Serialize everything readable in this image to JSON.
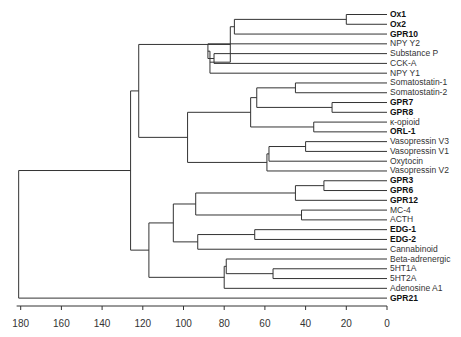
{
  "chart_data": {
    "type": "dendrogram",
    "title": "",
    "xlabel": "",
    "x_axis": {
      "ticks": [
        180,
        160,
        140,
        120,
        100,
        80,
        60,
        40,
        20,
        0
      ],
      "range": [
        180,
        0
      ]
    },
    "leaves": [
      {
        "label": "Ox1",
        "bold": true
      },
      {
        "label": "Ox2",
        "bold": true
      },
      {
        "label": "GPR10",
        "bold": true
      },
      {
        "label": "NPY Y2",
        "bold": false
      },
      {
        "label": "Substance P",
        "bold": false
      },
      {
        "label": "CCK-A",
        "bold": false
      },
      {
        "label": "NPY Y1",
        "bold": false
      },
      {
        "label": "Somatostatin-1",
        "bold": false
      },
      {
        "label": "Somatostatin-2",
        "bold": false
      },
      {
        "label": "GPR7",
        "bold": true
      },
      {
        "label": "GPR8",
        "bold": true
      },
      {
        "label": "κ-opioid",
        "bold": false
      },
      {
        "label": "ORL-1",
        "bold": true
      },
      {
        "label": "Vasopressin V3",
        "bold": false
      },
      {
        "label": "Vasopressin V1",
        "bold": false
      },
      {
        "label": "Oxytocin",
        "bold": false
      },
      {
        "label": "Vasopressin V2",
        "bold": false
      },
      {
        "label": "GPR3",
        "bold": true
      },
      {
        "label": "GPR6",
        "bold": true
      },
      {
        "label": "GPR12",
        "bold": true
      },
      {
        "label": "MC-4",
        "bold": false
      },
      {
        "label": "ACTH",
        "bold": false
      },
      {
        "label": "EDG-1",
        "bold": true
      },
      {
        "label": "EDG-2",
        "bold": true
      },
      {
        "label": "Cannabinoid",
        "bold": false
      },
      {
        "label": "Beta-adrenergic",
        "bold": false
      },
      {
        "label": "5HT1A",
        "bold": false
      },
      {
        "label": "5HT2A",
        "bold": false
      },
      {
        "label": "Adenosine A1",
        "bold": false
      },
      {
        "label": "GPR21",
        "bold": true
      }
    ],
    "merges": [
      {
        "children": [
          "Ox1",
          "Ox2"
        ],
        "height": 20
      },
      {
        "children": [
          "(Ox1,Ox2)",
          "GPR10"
        ],
        "height": 75
      },
      {
        "children": [
          "Substance P",
          "CCK-A"
        ],
        "height": 85
      },
      {
        "children": [
          "(SubP,CCK-A)",
          "NPY Y2"
        ],
        "height": 88
      },
      {
        "children": [
          "(NPY Y2..CCK-A)",
          "NPY Y1"
        ],
        "height": 87
      },
      {
        "children": [
          "(Ox..GPR10)",
          "(NPY..)"
        ],
        "height": 77
      },
      {
        "children": [
          "Somatostatin-1",
          "Somatostatin-2"
        ],
        "height": 45
      },
      {
        "children": [
          "GPR7",
          "GPR8"
        ],
        "height": 27
      },
      {
        "children": [
          "(Som)",
          "(GPR7,GPR8)"
        ],
        "height": 64
      },
      {
        "children": [
          "κ-opioid",
          "ORL-1"
        ],
        "height": 36
      },
      {
        "children": [
          "(Som..GPR8)",
          "(κ,ORL-1)"
        ],
        "height": 67
      },
      {
        "children": [
          "Vasopressin V3",
          "Vasopressin V1"
        ],
        "height": 40
      },
      {
        "children": [
          "(V3,V1)",
          "Oxytocin"
        ],
        "height": 58
      },
      {
        "children": [
          "(V3,V1,Oxy)",
          "Vasopressin V2"
        ],
        "height": 59
      },
      {
        "children": [
          "(Som..ORL-1)",
          "(Vaso)"
        ],
        "height": 97
      },
      {
        "children": [
          "(top peptide)",
          "(Som..Vaso)"
        ],
        "height": 98
      },
      {
        "children": [
          "(peptide)",
          "(Vaso group)"
        ],
        "height": 122
      },
      {
        "children": [
          "GPR3",
          "GPR6"
        ],
        "height": 31
      },
      {
        "children": [
          "(GPR3,GPR6)",
          "GPR12"
        ],
        "height": 45
      },
      {
        "children": [
          "MC-4",
          "ACTH"
        ],
        "height": 42
      },
      {
        "children": [
          "(GPR3..12)",
          "(MC-4,ACTH)"
        ],
        "height": 94
      },
      {
        "children": [
          "EDG-1",
          "EDG-2"
        ],
        "height": 65
      },
      {
        "children": [
          "(EDG)",
          "Cannabinoid"
        ],
        "height": 93
      },
      {
        "children": [
          "(GPR..ACTH)",
          "(EDG..Cannabinoid)"
        ],
        "height": 105
      },
      {
        "children": [
          "5HT1A",
          "5HT2A"
        ],
        "height": 56
      },
      {
        "children": [
          "Beta-adrenergic",
          "(5HT)"
        ],
        "height": 79
      },
      {
        "children": [
          "(Beta..5HT)",
          "Adenosine A1"
        ],
        "height": 80
      },
      {
        "children": [
          "(lipid/peptide)",
          "(amine)"
        ],
        "height": 117
      },
      {
        "children": [
          "(upper)",
          "(lower)"
        ],
        "height": 126
      },
      {
        "children": [
          "(all)",
          "GPR21"
        ],
        "height": 181
      }
    ]
  }
}
